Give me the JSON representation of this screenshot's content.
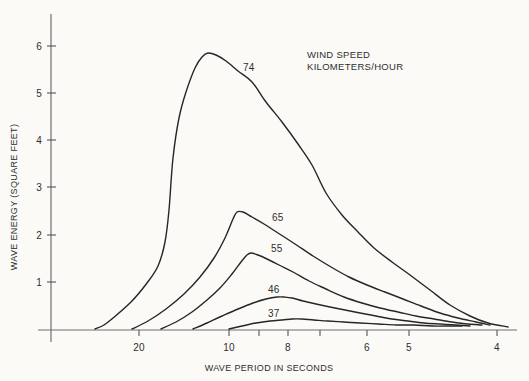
{
  "colors": {
    "background": "#fbfaf7",
    "curve": "#262626",
    "axis": "#6f6f6f",
    "text": "#2e2e2e"
  },
  "chart_data": {
    "type": "line",
    "title": "",
    "xlabel": "WAVE PERIOD IN SECONDS",
    "ylabel": "WAVE ENERGY (SQUARE FEET)",
    "legend": {
      "line1": "WIND SPEED",
      "line2": "KILOMETERS/HOUR",
      "position": "top-right"
    },
    "x_axis": {
      "label": "WAVE PERIOD IN SECONDS",
      "unit": "seconds",
      "direction": "period decreases left to right (nonlinear scale)",
      "ticks": [
        {
          "value": 20,
          "label": "20",
          "px": 139
        },
        {
          "value": 10,
          "label": "10",
          "px": 229
        },
        {
          "value": 9,
          "label": "",
          "px": 259
        },
        {
          "value": 8,
          "label": "8",
          "px": 288
        },
        {
          "value": 7,
          "label": "",
          "px": 320
        },
        {
          "value": 6,
          "label": "6",
          "px": 367
        },
        {
          "value": 5,
          "label": "5",
          "px": 409
        },
        {
          "value": 4,
          "label": "4",
          "px": 497
        }
      ]
    },
    "y_axis": {
      "label": "WAVE ENERGY (SQUARE FEET)",
      "range": [
        0,
        6.6
      ],
      "grid": false,
      "ticks": [
        {
          "value": 1,
          "label": "1",
          "px": 282
        },
        {
          "value": 2,
          "label": "2",
          "px": 235
        },
        {
          "value": 3,
          "label": "3",
          "px": 187
        },
        {
          "value": 4,
          "label": "4",
          "px": 140
        },
        {
          "value": 5,
          "label": "5",
          "px": 93
        },
        {
          "value": 6,
          "label": "6",
          "px": 46
        }
      ]
    },
    "series": [
      {
        "name": "wind speed 74 km/h",
        "label": "74",
        "label_px": [
          243,
          62
        ],
        "peak": {
          "period_s": 12.3,
          "energy_sqft": 5.9
        },
        "points": [
          [
            25,
            0
          ],
          [
            19,
            1.0
          ],
          [
            17,
            2.1
          ],
          [
            16,
            3.8
          ],
          [
            15,
            4.9
          ],
          [
            13.8,
            5.6
          ],
          [
            12.3,
            5.9
          ],
          [
            10.3,
            5.7
          ],
          [
            9.2,
            5.3
          ],
          [
            8.2,
            4.4
          ],
          [
            7.3,
            3.5
          ],
          [
            6.5,
            2.5
          ],
          [
            5.8,
            1.7
          ],
          [
            5.0,
            1.2
          ],
          [
            4.5,
            0.5
          ],
          [
            3.9,
            0.1
          ]
        ],
        "px": [
          [
            95,
            329
          ],
          [
            104,
            325
          ],
          [
            113,
            318
          ],
          [
            131,
            302
          ],
          [
            147,
            283
          ],
          [
            158,
            266
          ],
          [
            165,
            242
          ],
          [
            169,
            210
          ],
          [
            173,
            158
          ],
          [
            179,
            118
          ],
          [
            186,
            92
          ],
          [
            195,
            68
          ],
          [
            202,
            57
          ],
          [
            208,
            53
          ],
          [
            216,
            55
          ],
          [
            226,
            61
          ],
          [
            238,
            71
          ],
          [
            252,
            82
          ],
          [
            266,
            102
          ],
          [
            282,
            122
          ],
          [
            298,
            144
          ],
          [
            312,
            165
          ],
          [
            326,
            193
          ],
          [
            342,
            215
          ],
          [
            358,
            232
          ],
          [
            374,
            248
          ],
          [
            392,
            262
          ],
          [
            410,
            275
          ],
          [
            430,
            290
          ],
          [
            450,
            305
          ],
          [
            470,
            316
          ],
          [
            488,
            323
          ],
          [
            508,
            327
          ]
        ]
      },
      {
        "name": "wind speed 65 km/h",
        "label": "65",
        "label_px": [
          272,
          212
        ],
        "peak": {
          "period_s": 9.7,
          "energy_sqft": 2.5
        },
        "points": [
          [
            20.8,
            0
          ],
          [
            17,
            0.5
          ],
          [
            15,
            0.8
          ],
          [
            13.2,
            1.1
          ],
          [
            11.7,
            1.5
          ],
          [
            10.4,
            2.0
          ],
          [
            9.7,
            2.5
          ],
          [
            8.3,
            2.1
          ],
          [
            7.2,
            1.6
          ],
          [
            6.4,
            1.1
          ],
          [
            5.6,
            0.8
          ],
          [
            4.9,
            0.5
          ],
          [
            4.4,
            0.3
          ],
          [
            4.1,
            0.1
          ]
        ],
        "px": [
          [
            132,
            329
          ],
          [
            148,
            321
          ],
          [
            166,
            309
          ],
          [
            184,
            294
          ],
          [
            200,
            277
          ],
          [
            214,
            258
          ],
          [
            225,
            238
          ],
          [
            233,
            219
          ],
          [
            237,
            212
          ],
          [
            243,
            212
          ],
          [
            252,
            217
          ],
          [
            264,
            224
          ],
          [
            278,
            233
          ],
          [
            295,
            244
          ],
          [
            313,
            256
          ],
          [
            331,
            267
          ],
          [
            349,
            277
          ],
          [
            367,
            285
          ],
          [
            385,
            292
          ],
          [
            403,
            299
          ],
          [
            421,
            306
          ],
          [
            440,
            313
          ],
          [
            458,
            318
          ],
          [
            476,
            322
          ],
          [
            490,
            325
          ]
        ]
      },
      {
        "name": "wind speed 55 km/h",
        "label": "55",
        "label_px": [
          271,
          243
        ],
        "peak": {
          "period_s": 9.3,
          "energy_sqft": 1.6
        },
        "points": [
          [
            17.6,
            0
          ],
          [
            14,
            0.4
          ],
          [
            11,
            0.9
          ],
          [
            9.6,
            1.5
          ],
          [
            9.3,
            1.6
          ],
          [
            8.3,
            1.4
          ],
          [
            7.3,
            1.0
          ],
          [
            6.5,
            0.7
          ],
          [
            5.7,
            0.5
          ],
          [
            4.9,
            0.3
          ],
          [
            4.5,
            0.2
          ],
          [
            4.2,
            0.1
          ]
        ],
        "px": [
          [
            161,
            329
          ],
          [
            176,
            322
          ],
          [
            192,
            312
          ],
          [
            207,
            300
          ],
          [
            220,
            288
          ],
          [
            232,
            274
          ],
          [
            241,
            262
          ],
          [
            247,
            255
          ],
          [
            251,
            253
          ],
          [
            258,
            255
          ],
          [
            267,
            259
          ],
          [
            279,
            265
          ],
          [
            293,
            272
          ],
          [
            309,
            281
          ],
          [
            326,
            289
          ],
          [
            344,
            297
          ],
          [
            362,
            303
          ],
          [
            380,
            308
          ],
          [
            398,
            312
          ],
          [
            416,
            316
          ],
          [
            434,
            319
          ],
          [
            452,
            322
          ],
          [
            468,
            324
          ],
          [
            482,
            325
          ]
        ]
      },
      {
        "name": "wind speed 46 km/h",
        "label": "46",
        "label_px": [
          268,
          284
        ],
        "peak": {
          "period_s": 8.2,
          "energy_sqft": 0.7
        },
        "points": [
          [
            14,
            0
          ],
          [
            10.8,
            0.3
          ],
          [
            9.2,
            0.6
          ],
          [
            8.2,
            0.7
          ],
          [
            7.5,
            0.6
          ],
          [
            6.8,
            0.5
          ],
          [
            6.2,
            0.4
          ],
          [
            5.4,
            0.2
          ],
          [
            4.8,
            0.15
          ],
          [
            4.3,
            0.1
          ]
        ],
        "px": [
          [
            193,
            329
          ],
          [
            207,
            323
          ],
          [
            222,
            316
          ],
          [
            238,
            309
          ],
          [
            253,
            303
          ],
          [
            266,
            299
          ],
          [
            277,
            297
          ],
          [
            284,
            297
          ],
          [
            292,
            298
          ],
          [
            303,
            301
          ],
          [
            316,
            304
          ],
          [
            330,
            307
          ],
          [
            345,
            310
          ],
          [
            360,
            313
          ],
          [
            376,
            316
          ],
          [
            392,
            319
          ],
          [
            408,
            321
          ],
          [
            424,
            323
          ],
          [
            440,
            324
          ],
          [
            456,
            325
          ],
          [
            470,
            326
          ]
        ]
      },
      {
        "name": "wind speed 37 km/h",
        "label": "37",
        "label_px": [
          268,
          308
        ],
        "peak": {
          "period_s": 7.9,
          "energy_sqft": 0.23
        },
        "points": [
          [
            10,
            0
          ],
          [
            9.1,
            0.15
          ],
          [
            8.2,
            0.2
          ],
          [
            7.9,
            0.23
          ],
          [
            7.2,
            0.2
          ],
          [
            6.5,
            0.17
          ],
          [
            5.7,
            0.13
          ],
          [
            4.9,
            0.1
          ],
          [
            4.5,
            0.09
          ]
        ],
        "px": [
          [
            229,
            329
          ],
          [
            242,
            326
          ],
          [
            256,
            323
          ],
          [
            270,
            321
          ],
          [
            282,
            320
          ],
          [
            292,
            319
          ],
          [
            302,
            319
          ],
          [
            314,
            320
          ],
          [
            328,
            321
          ],
          [
            344,
            322
          ],
          [
            360,
            323
          ],
          [
            378,
            324
          ],
          [
            396,
            325
          ],
          [
            414,
            325
          ],
          [
            432,
            326
          ],
          [
            450,
            326
          ],
          [
            462,
            326
          ]
        ]
      }
    ],
    "layout": {
      "origin_px": {
        "x": 51,
        "y": 330
      },
      "y_axis_top_px": 14,
      "y_axis_bottom_px": 342,
      "x_axis_left_px": 38,
      "x_axis_right_px": 517,
      "x_tick_bottom_px": 336,
      "y_tick_x1_px": 47,
      "y_tick_x2_px": 56
    }
  }
}
